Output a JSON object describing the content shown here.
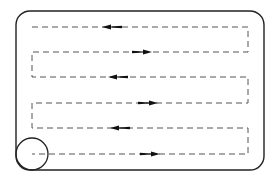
{
  "diagram": {
    "stroke_color": "#222222",
    "dash_color": "#555555",
    "boundary": {
      "x": 16,
      "y": 11,
      "w": 248,
      "h": 159,
      "r": 14
    },
    "start_circle": {
      "cx": 32,
      "cy": 154,
      "r": 16
    },
    "path_rows": [
      {
        "y": 27,
        "direction": "left",
        "arrow_x": 112
      },
      {
        "y": 52,
        "direction": "right",
        "arrow_x": 142
      },
      {
        "y": 77,
        "direction": "left",
        "arrow_x": 118
      },
      {
        "y": 103,
        "direction": "right",
        "arrow_x": 148
      },
      {
        "y": 128,
        "direction": "left",
        "arrow_x": 120
      },
      {
        "y": 154,
        "direction": "right",
        "arrow_x": 150
      }
    ],
    "path_x_left": 32,
    "path_x_right": 248
  }
}
